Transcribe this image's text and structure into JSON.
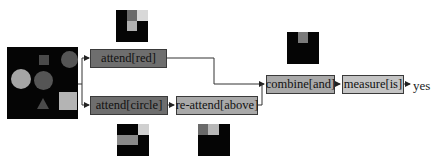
{
  "diagram": {
    "type": "neural-module-network",
    "input_image": {
      "label": "input-scene",
      "shapes": [
        {
          "kind": "square",
          "shade": "#4a4a4a",
          "x": 32,
          "y": 8,
          "w": 10,
          "h": 10
        },
        {
          "kind": "circle",
          "shade": "#555555",
          "x": 56,
          "y": 4,
          "w": 17,
          "h": 17
        },
        {
          "kind": "circle",
          "shade": "#a6a6a6",
          "x": 5,
          "y": 22,
          "w": 20,
          "h": 20
        },
        {
          "kind": "circle",
          "shade": "#555555",
          "x": 28,
          "y": 24,
          "w": 19,
          "h": 19
        },
        {
          "kind": "triangle",
          "shade": "#4a4a4a",
          "x": 30,
          "y": 50,
          "w": 12,
          "h": 12
        },
        {
          "kind": "square",
          "shade": "#b4b4b4",
          "x": 52,
          "y": 44,
          "w": 18,
          "h": 18
        }
      ]
    },
    "nodes": [
      {
        "id": "attend_red",
        "label": "attend[red]",
        "style": "dark"
      },
      {
        "id": "attend_circle",
        "label": "attend[circle]",
        "style": "dark"
      },
      {
        "id": "reattend_above",
        "label": "re-attend[above]",
        "style": "light"
      },
      {
        "id": "combine_and",
        "label": "combine[and]",
        "style": "light"
      },
      {
        "id": "measure_is",
        "label": "measure[is]",
        "style": "lighter"
      }
    ],
    "edges": [
      [
        "input",
        "attend_red"
      ],
      [
        "input",
        "attend_circle"
      ],
      [
        "attend_circle",
        "reattend_above"
      ],
      [
        "attend_red",
        "combine_and"
      ],
      [
        "reattend_above",
        "combine_and"
      ],
      [
        "combine_and",
        "measure_is"
      ],
      [
        "measure_is",
        "answer"
      ]
    ],
    "answer": "yes",
    "attention_maps": [
      {
        "for": "attend_red",
        "cells": [
          {
            "x": 11,
            "y": 0,
            "w": 10,
            "h": 11,
            "shade": "#6a6a6a"
          },
          {
            "x": 21,
            "y": 0,
            "w": 11,
            "h": 11,
            "shade": "#d8d8d8"
          },
          {
            "x": 11,
            "y": 11,
            "w": 10,
            "h": 10,
            "shade": "#b0b0b0"
          }
        ]
      },
      {
        "for": "attend_circle",
        "cells": [
          {
            "x": 21,
            "y": 0,
            "w": 11,
            "h": 11,
            "shade": "#d0d0d0"
          },
          {
            "x": 0,
            "y": 11,
            "w": 21,
            "h": 10,
            "shade": "#8a8a8a"
          }
        ]
      },
      {
        "for": "reattend_above",
        "cells": [
          {
            "x": 0,
            "y": 0,
            "w": 10,
            "h": 11,
            "shade": "#6a6a6a"
          },
          {
            "x": 10,
            "y": 0,
            "w": 11,
            "h": 11,
            "shade": "#b8b8b8"
          }
        ]
      },
      {
        "for": "combine_and",
        "cells": [
          {
            "x": 11,
            "y": 0,
            "w": 10,
            "h": 11,
            "shade": "#7a7a7a"
          }
        ]
      }
    ]
  }
}
